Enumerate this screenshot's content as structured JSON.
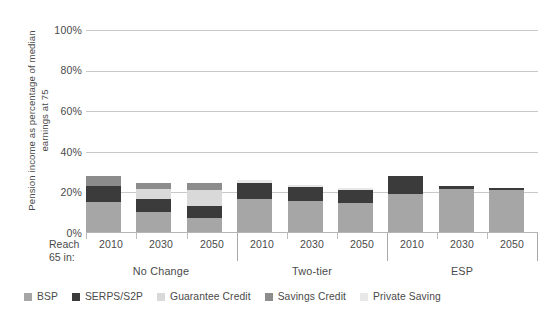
{
  "chart_data": {
    "type": "bar",
    "subtype": "stacked-column-grouped",
    "title": "",
    "xlabel": "",
    "ylabel": "Pension income as percentage of median earnings at 75",
    "ylim": [
      0,
      100
    ],
    "yticks": [
      "0%",
      "20%",
      "40%",
      "60%",
      "80%",
      "100%"
    ],
    "ytick_values": [
      0,
      20,
      40,
      60,
      80,
      100
    ],
    "grid": true,
    "legend_position": "bottom",
    "row_label": "Reach 65 in:",
    "groups": [
      "No Change",
      "Two-tier",
      "ESP"
    ],
    "categories": [
      "2010",
      "2030",
      "2050",
      "2010",
      "2030",
      "2050",
      "2010",
      "2030",
      "2050"
    ],
    "series": [
      {
        "name": "BSP",
        "color": "#a6a6a6",
        "values": [
          15.0,
          10.0,
          7.0,
          16.5,
          15.5,
          14.5,
          19.0,
          21.5,
          21.0
        ]
      },
      {
        "name": "SERPS/S2P",
        "color": "#3b3b3b",
        "values": [
          8.0,
          6.5,
          6.0,
          8.0,
          7.0,
          6.5,
          8.5,
          1.5,
          1.0
        ]
      },
      {
        "name": "Guarantee Credit",
        "color": "#d9d9d9",
        "values": [
          0.0,
          5.0,
          8.0,
          0.0,
          0.0,
          0.0,
          0.0,
          0.0,
          0.0
        ]
      },
      {
        "name": "Savings Credit",
        "color": "#8c8c8c",
        "values": [
          4.5,
          3.0,
          3.5,
          0.0,
          0.0,
          0.0,
          0.0,
          0.0,
          0.0
        ]
      },
      {
        "name": "Private Saving",
        "color": "#e8e8e8",
        "values": [
          0.0,
          0.0,
          0.0,
          1.5,
          1.0,
          1.0,
          0.0,
          0.0,
          0.0
        ]
      }
    ],
    "totals": [
      27.5,
      24.5,
      24.5,
      26.0,
      23.5,
      22.0,
      27.5,
      23.0,
      22.0
    ]
  },
  "axis": {
    "y_title": "Pension income as percentage of median earnings at 75",
    "y_ticks": [
      {
        "label": "100%",
        "value": 100
      },
      {
        "label": "80%",
        "value": 80
      },
      {
        "label": "60%",
        "value": 60
      },
      {
        "label": "40%",
        "value": 40
      },
      {
        "label": "20%",
        "value": 20
      },
      {
        "label": "0%",
        "value": 0
      }
    ],
    "row_label_line1": "Reach",
    "row_label_line2": "65 in:",
    "x_ticks": [
      "2010",
      "2030",
      "2050",
      "2010",
      "2030",
      "2050",
      "2010",
      "2030",
      "2050"
    ],
    "group_labels": [
      "No Change",
      "Two-tier",
      "ESP"
    ]
  },
  "legend": {
    "items": [
      {
        "label": "BSP",
        "color": "#a6a6a6"
      },
      {
        "label": "SERPS/S2P",
        "color": "#3b3b3b"
      },
      {
        "label": "Guarantee Credit",
        "color": "#d9d9d9"
      },
      {
        "label": "Savings Credit",
        "color": "#8c8c8c"
      },
      {
        "label": "Private Saving",
        "color": "#e8e8e8"
      }
    ]
  },
  "style": {
    "gridline_color": "#c9c9c9",
    "text_color": "#4a4a4a",
    "background": "#ffffff"
  }
}
